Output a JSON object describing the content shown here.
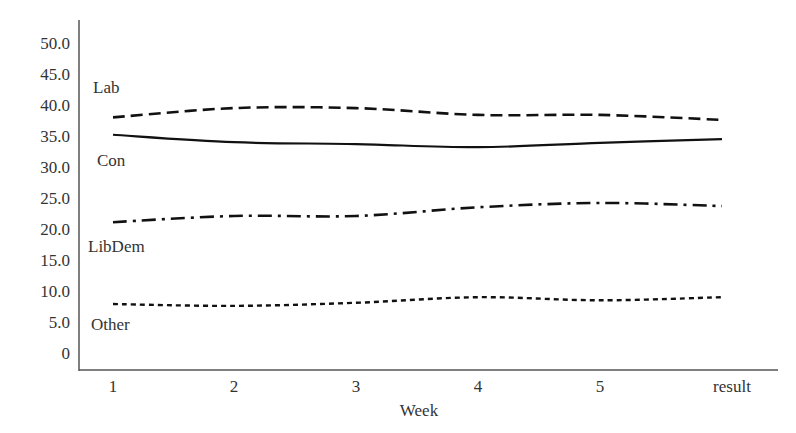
{
  "chart_data": {
    "type": "line",
    "title": "",
    "xlabel": "Week",
    "ylabel": "",
    "categories": [
      "1",
      "2",
      "3",
      "4",
      "5",
      "result"
    ],
    "y_ticks": [
      "50.0",
      "45.0",
      "40.0",
      "35.0",
      "30.0",
      "25.0",
      "20.0",
      "15.0",
      "10.0",
      "5.0",
      "0"
    ],
    "ylim": [
      0,
      50
    ],
    "grid": false,
    "legend_position": "inline-left",
    "series": [
      {
        "name": "Lab",
        "line_style": "dashed",
        "values": [
          38.0,
          39.5,
          39.5,
          38.4,
          38.4,
          37.6
        ]
      },
      {
        "name": "Con",
        "line_style": "solid",
        "values": [
          35.2,
          34.0,
          33.7,
          33.2,
          33.9,
          34.5
        ]
      },
      {
        "name": "LibDem",
        "line_style": "dash-dot",
        "values": [
          21.1,
          22.1,
          22.1,
          23.5,
          24.2,
          23.7
        ]
      },
      {
        "name": "Other",
        "line_style": "dotted",
        "values": [
          7.9,
          7.6,
          8.1,
          9.0,
          8.5,
          9.0
        ]
      }
    ]
  },
  "colors": {
    "line": "#111111",
    "axis": "#555555",
    "text": "#333333",
    "background": "#ffffff"
  }
}
